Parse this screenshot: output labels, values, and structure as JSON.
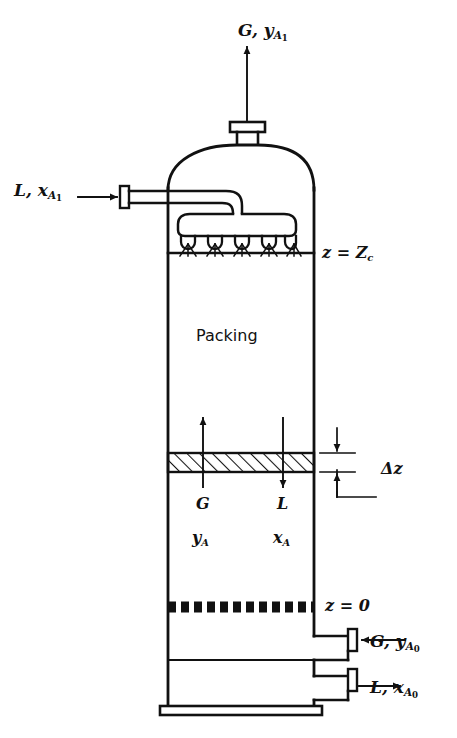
{
  "figure": {
    "type": "process-flow-diagram",
    "background_color": "#ffffff",
    "line_color": "#111111"
  },
  "labels": {
    "gas_outlet": {
      "text": "G, y",
      "sub": "A",
      "sub2": "1"
    },
    "liquid_inlet": {
      "text": "L, x",
      "sub": "A",
      "sub2": "1"
    },
    "top_of_packing": {
      "text": "z = Z",
      "sub": "c"
    },
    "packing_zone": {
      "text": "Packing"
    },
    "gas_flow_mid": {
      "text": "G"
    },
    "liquid_flow_mid": {
      "text": "L"
    },
    "gas_composition_mid": {
      "text": "y",
      "sub": "A"
    },
    "liquid_composition_mid": {
      "text": "x",
      "sub": "A"
    },
    "differential_height": {
      "text": "Δz"
    },
    "bottom_of_packing": {
      "text": "z = 0"
    },
    "gas_inlet": {
      "text": "G, y",
      "sub": "A",
      "sub2": "0"
    },
    "liquid_outlet": {
      "text": "L, x",
      "sub": "A",
      "sub2": "0"
    }
  },
  "components": {
    "top_nozzle": "gas outlet nozzle with flange",
    "dome": "elliptical top head",
    "liquid_inlet_pipe": "horizontal pipe with flange",
    "spray_distributor": "liquid distributor header with 5 spray nozzles",
    "spray_nozzle_count": 5,
    "packing_section": "randomly packed bed",
    "differential_element": "hatched control volume of height delta z",
    "support_grid": "dashed packing support plate at z = 0",
    "gas_inlet_nozzle": "lower side nozzle with flange, flow into column",
    "liquid_outlet_nozzle": "bottom side nozzle with flange, flow out of column",
    "base_plate": "column base support"
  },
  "flow_directions": {
    "gas_outlet_arrow": "up",
    "liquid_inlet_arrow": "right-into-column",
    "gas_mid_arrow": "up",
    "liquid_mid_arrow": "down",
    "gas_inlet_arrow": "left-into-column",
    "liquid_outlet_arrow": "right-out-of-column"
  },
  "geometry": {
    "column_left_x": 168,
    "column_right_x": 314,
    "z_equals_Zc_y": 253,
    "z_equals_zero_y": 607,
    "element_top_y": 453,
    "element_bottom_y": 472
  }
}
